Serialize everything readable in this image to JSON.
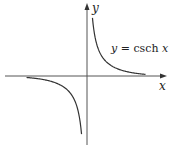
{
  "chart_data": {
    "type": "line",
    "title": "",
    "function": "y = csch x",
    "xlabel": "x",
    "ylabel": "y",
    "annotation": "y = csch x",
    "grid": false,
    "legend": "none",
    "ticks": "none",
    "series": [
      {
        "name": "csch x (x > 0)",
        "x": [
          0.1,
          0.25,
          0.5,
          0.75,
          1.0,
          1.5,
          2.0,
          2.5,
          3.0
        ],
        "values": [
          9.98,
          3.96,
          1.92,
          1.22,
          0.85,
          0.47,
          0.28,
          0.17,
          0.1
        ]
      },
      {
        "name": "csch x (x < 0)",
        "x": [
          -3.0,
          -2.5,
          -2.0,
          -1.5,
          -1.0,
          -0.75,
          -0.5,
          -0.25,
          -0.1
        ],
        "values": [
          -0.1,
          -0.17,
          -0.28,
          -0.47,
          -0.85,
          -1.22,
          -1.92,
          -3.96,
          -9.98
        ]
      }
    ],
    "xlim": [
      -3.2,
      3.5
    ],
    "ylim": [
      -3.5,
      3.5
    ]
  },
  "labels": {
    "x_axis": "x",
    "y_axis": "y",
    "curve_label_lhs": "y",
    "curve_label_eq": " = csch ",
    "curve_label_rhs": "x"
  },
  "colors": {
    "axis": "#555555",
    "curve": "#333333",
    "background": "#ffffff"
  }
}
